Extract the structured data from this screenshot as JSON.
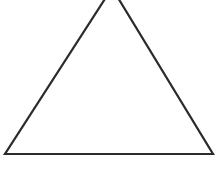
{
  "diagram": {
    "shape": "triangle",
    "stroke_color": "#2b2b2b",
    "fill_color": "#ffffff",
    "background": "#ffffff",
    "points": "112,-12 5,154 213,154",
    "stroke_width": "2.2"
  },
  "caption": {
    "text": ""
  }
}
